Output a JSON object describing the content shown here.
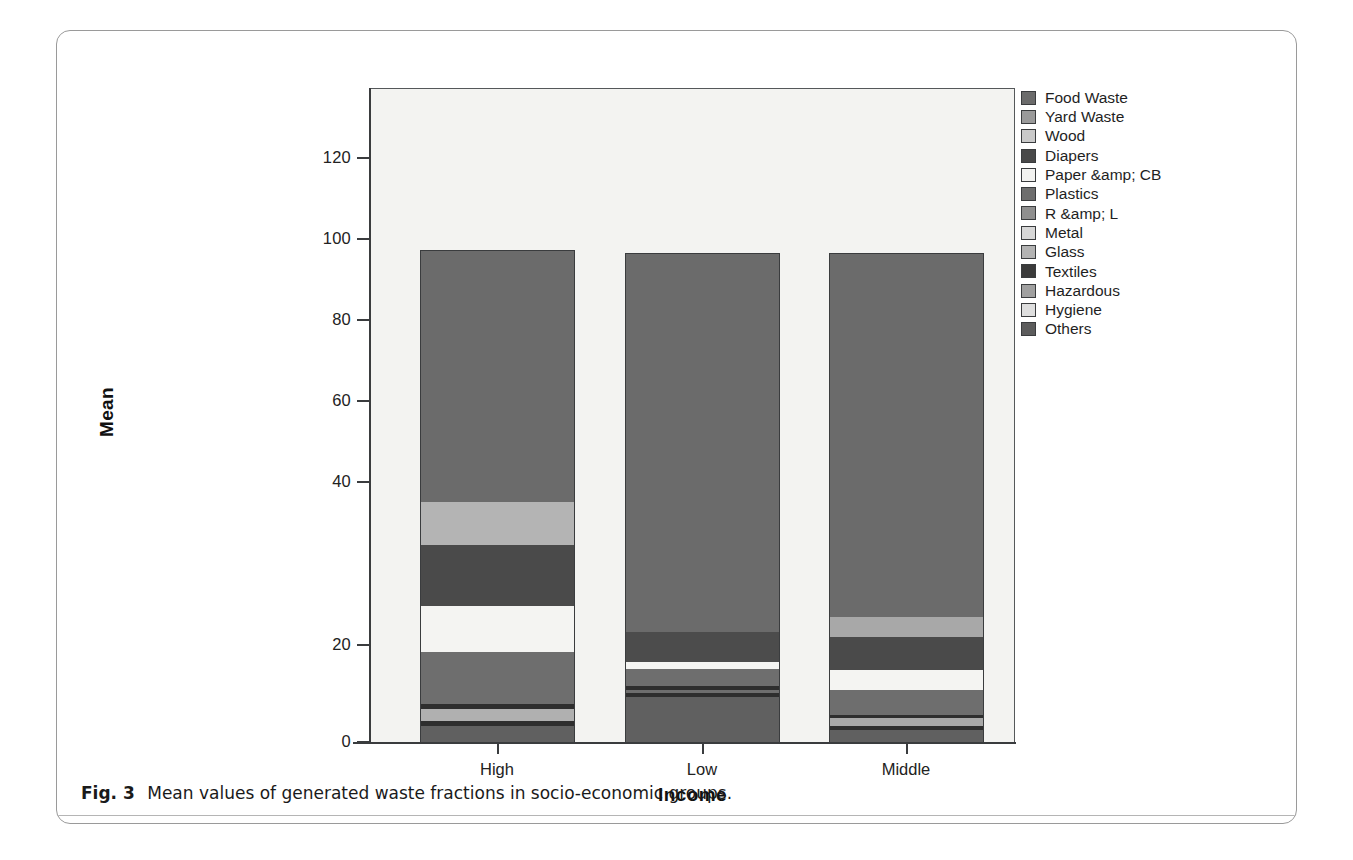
{
  "figure": {
    "caption_label": "Fig. 3",
    "caption_text": "Mean values of generated waste fractions in socio-economic groups."
  },
  "chart_data": {
    "type": "bar",
    "subtype": "stacked",
    "title": "",
    "xlabel": "Income",
    "ylabel": "Mean",
    "categories": [
      "High",
      "Low",
      "Middle"
    ],
    "ylim": [
      0,
      133
    ],
    "yticks": [
      0,
      20,
      40,
      60,
      80,
      100,
      120
    ],
    "ytick_labels": [
      "0",
      "20",
      "40",
      "60",
      "80",
      "100",
      "120"
    ],
    "grid": false,
    "legend_position": "right",
    "series": [
      {
        "name": "Food Waste",
        "color": "#6b6b6b",
        "values": [
          51.5,
          77.4,
          70.0
        ]
      },
      {
        "name": "Yard Waste",
        "color": "#9a9a9a",
        "values": [
          2.4,
          0.0,
          4.1
        ]
      },
      {
        "name": "Wood",
        "color": "#c9c9c9",
        "values": [
          0.0,
          0.0,
          0.0
        ]
      },
      {
        "name": "Diapers",
        "color": "#494949",
        "values": [
          2.6,
          0.0,
          0.0
        ]
      },
      {
        "name": "Paper &amp; CB",
        "color": "#f2f2f0",
        "values": [
          2.5,
          0.0,
          0.0
        ]
      },
      {
        "name": "Plastics",
        "color": "#6e6e6e",
        "values": [
          9.8,
          0.0,
          0.0
        ]
      },
      {
        "name": "R &amp; L",
        "color": "#8f8f8f",
        "values": [
          2.4,
          0.0,
          6.7
        ]
      },
      {
        "name": "Metal",
        "color": "#d7d7d7",
        "values": [
          0.0,
          0.0,
          0.0
        ]
      },
      {
        "name": "Glass",
        "color": "#b3b3b3",
        "values": [
          0.0,
          0.0,
          0.0
        ]
      },
      {
        "name": "Textiles",
        "color": "#3b3b3b",
        "values": [
          0.0,
          1.2,
          2.8
        ]
      },
      {
        "name": "Hazardous",
        "color": "#a0a0a0",
        "values": [
          2.0,
          1.1,
          1.6
        ]
      },
      {
        "name": "Hygiene",
        "color": "#dedede",
        "values": [
          0.0,
          0.0,
          0.0
        ]
      },
      {
        "name": "Others",
        "color": "#5c5c5c",
        "values": [
          25.9,
          21.0,
          15.3
        ]
      }
    ],
    "totals": [
      101.1,
      100.7,
      100.5
    ]
  },
  "bars": [
    {
      "category": "High",
      "total": 101.1,
      "left_px": 363,
      "top_px": 219,
      "segments": [
        {
          "label": "Food Waste",
          "color": "#6b6b6b",
          "top_px": 219,
          "height_px": 251
        },
        {
          "label": "Yard Waste",
          "color": "#b4b4b4",
          "top_px": 470,
          "height_px": 43
        },
        {
          "label": "Diapers",
          "color": "#4a4a4a",
          "top_px": 513,
          "height_px": 61
        },
        {
          "label": "Paper &amp; CB",
          "color": "#f4f4f2",
          "top_px": 574,
          "height_px": 46
        },
        {
          "label": "Plastics",
          "color": "#6e6e6e",
          "top_px": 620,
          "height_px": 52
        },
        {
          "label": "Textiles",
          "color": "#2e2e2e",
          "top_px": 672,
          "height_px": 5
        },
        {
          "label": "Hazardous",
          "color": "#b0b0b0",
          "top_px": 677,
          "height_px": 12
        },
        {
          "label": "Hygiene",
          "color": "#2e2e2e",
          "top_px": 689,
          "height_px": 5
        },
        {
          "label": "Others",
          "color": "#606060",
          "top_px": 694,
          "height_px": 18
        }
      ]
    },
    {
      "category": "Low",
      "total": 100.7,
      "left_px": 568,
      "top_px": 222,
      "segments": [
        {
          "label": "Food Waste",
          "color": "#6b6b6b",
          "top_px": 222,
          "height_px": 378
        },
        {
          "label": "Diapers",
          "color": "#4c4c4c",
          "top_px": 600,
          "height_px": 30
        },
        {
          "label": "Paper &amp; CB",
          "color": "#f4f4f2",
          "top_px": 630,
          "height_px": 7
        },
        {
          "label": "Plastics",
          "color": "#6e6e6e",
          "top_px": 637,
          "height_px": 17
        },
        {
          "label": "Textiles",
          "color": "#2e2e2e",
          "top_px": 654,
          "height_px": 4
        },
        {
          "label": "Hazardous",
          "color": "#6e6e6e",
          "top_px": 658,
          "height_px": 3
        },
        {
          "label": "Hygiene",
          "color": "#2e2e2e",
          "top_px": 661,
          "height_px": 4
        },
        {
          "label": "Others",
          "color": "#606060",
          "top_px": 665,
          "height_px": 47
        }
      ]
    },
    {
      "category": "Middle",
      "total": 100.5,
      "left_px": 772,
      "top_px": 222,
      "segments": [
        {
          "label": "Food Waste",
          "color": "#6b6b6b",
          "top_px": 222,
          "height_px": 363
        },
        {
          "label": "Yard Waste",
          "color": "#a8a8a8",
          "top_px": 585,
          "height_px": 20
        },
        {
          "label": "Diapers",
          "color": "#4a4a4a",
          "top_px": 605,
          "height_px": 33
        },
        {
          "label": "Paper &amp; CB",
          "color": "#f4f4f2",
          "top_px": 638,
          "height_px": 20
        },
        {
          "label": "R &amp; L",
          "color": "#6e6e6e",
          "top_px": 658,
          "height_px": 25
        },
        {
          "label": "Textiles",
          "color": "#2e2e2e",
          "top_px": 683,
          "height_px": 3
        },
        {
          "label": "Hazardous",
          "color": "#a8a8a8",
          "top_px": 686,
          "height_px": 8
        },
        {
          "label": "Hygiene",
          "color": "#2e2e2e",
          "top_px": 694,
          "height_px": 4
        },
        {
          "label": "Others",
          "color": "#606060",
          "top_px": 698,
          "height_px": 14
        }
      ]
    }
  ],
  "axes": {
    "y": {
      "title": "Mean",
      "ticks": [
        {
          "label": "120",
          "y_px": 127
        },
        {
          "label": "100",
          "y_px": 208
        },
        {
          "label": "80",
          "y_px": 289
        },
        {
          "label": "60",
          "y_px": 370
        },
        {
          "label": "40",
          "y_px": 451
        },
        {
          "label": "20",
          "y_px": 614
        },
        {
          "label": "0",
          "y_px": 711
        }
      ]
    },
    "x": {
      "title": "Income",
      "ticks": [
        {
          "label": "High",
          "x_px": 440
        },
        {
          "label": "Low",
          "x_px": 645
        },
        {
          "label": "Middle",
          "x_px": 849
        }
      ]
    }
  },
  "legend": {
    "items": [
      {
        "label": "Food Waste",
        "color": "#6b6b6b"
      },
      {
        "label": "Yard Waste",
        "color": "#9a9a9a"
      },
      {
        "label": "Wood",
        "color": "#c9c9c9"
      },
      {
        "label": "Diapers",
        "color": "#494949"
      },
      {
        "label": "Paper &amp; CB",
        "color": "#f2f2f0"
      },
      {
        "label": "Plastics",
        "color": "#6e6e6e"
      },
      {
        "label": "R &amp; L",
        "color": "#8f8f8f"
      },
      {
        "label": "Metal",
        "color": "#d7d7d7"
      },
      {
        "label": "Glass",
        "color": "#b3b3b3"
      },
      {
        "label": "Textiles",
        "color": "#3b3b3b"
      },
      {
        "label": "Hazardous",
        "color": "#a0a0a0"
      },
      {
        "label": "Hygiene",
        "color": "#dedede"
      },
      {
        "label": "Others",
        "color": "#5c5c5c"
      }
    ]
  },
  "colors": {
    "panel_background": "#f3f3f1",
    "axis": "#3a3c3e",
    "card_border": "#9a9a9a",
    "caption_rule": "#b5b5b5"
  }
}
